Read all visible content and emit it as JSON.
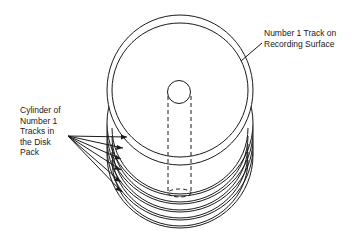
{
  "diagram": {
    "labels": {
      "track": "Number 1 Track on\nRecording Surface",
      "cylinder": "Cylinder of\nNumber 1\nTracks in\nthe Disk\nPack"
    },
    "disk_count": 6,
    "colors": {
      "stroke": "#1a1a1a",
      "background": "#ffffff"
    }
  }
}
